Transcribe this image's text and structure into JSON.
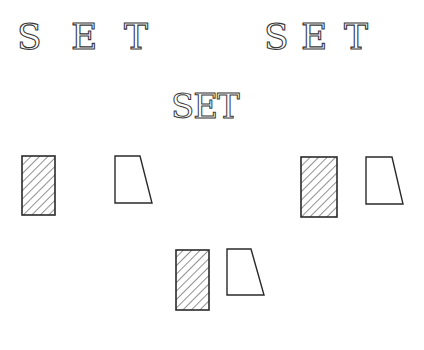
{
  "diagram": {
    "top_left_letters": [
      "S",
      "E",
      "T"
    ],
    "top_right_letters": [
      "S",
      "E",
      "T"
    ],
    "center_word": "SET",
    "groups": [
      {
        "name": "left",
        "hatched_rect": [
          22,
          156,
          33,
          59
        ],
        "trapezoid": [
          [
            115,
            156
          ],
          [
            140,
            156
          ],
          [
            152,
            203
          ],
          [
            115,
            203
          ]
        ]
      },
      {
        "name": "right",
        "hatched_rect": [
          301,
          157,
          36,
          60
        ],
        "trapezoid": [
          [
            366,
            157
          ],
          [
            392,
            157
          ],
          [
            403,
            204
          ],
          [
            366,
            204
          ]
        ]
      },
      {
        "name": "bottom",
        "hatched_rect": [
          176,
          250,
          33,
          60
        ],
        "trapezoid": [
          [
            227,
            249
          ],
          [
            251,
            249
          ],
          [
            264,
            295
          ],
          [
            227,
            295
          ]
        ]
      }
    ],
    "stroke_color": "#2a2a2a",
    "background": "#ffffff"
  }
}
